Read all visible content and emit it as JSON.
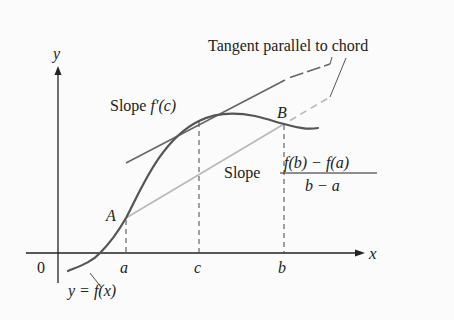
{
  "figure": {
    "axes": {
      "x_label": "x",
      "y_label": "y",
      "origin_label": "0"
    },
    "ticks": {
      "a": "a",
      "c": "c",
      "b": "b"
    },
    "points": {
      "A": "A",
      "B": "B"
    },
    "labels": {
      "tangent_note": "Tangent parallel to chord",
      "slope_tangent_prefix": "Slope ",
      "slope_tangent_expr": "f′(c)",
      "slope_chord_prefix": "Slope",
      "slope_chord_numerator": "f(b) − f(a)",
      "slope_chord_denominator": "b − a",
      "curve_label": "y = f(x)"
    },
    "colors": {
      "curve": "#555555",
      "tangent": "#666666",
      "chord": "#b8b8b8",
      "axes": "#222222",
      "text": "#222222",
      "background": "#fbfbfb"
    }
  }
}
